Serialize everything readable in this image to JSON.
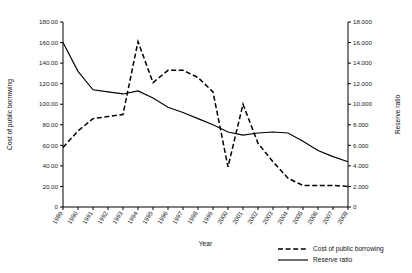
{
  "chart_data": {
    "type": "line",
    "title": "",
    "xlabel": "Year",
    "ylabel": "Cost of public borrowing",
    "y2label": "Reserve ratio",
    "grid": false,
    "legend_position": "bottom-right",
    "x": [
      1989,
      1990,
      1991,
      1992,
      1993,
      1994,
      1995,
      1996,
      1997,
      1998,
      1999,
      2000,
      2001,
      2002,
      2003,
      2004,
      2005,
      2006,
      2007,
      2008
    ],
    "categories": [
      "1989",
      "1990",
      "1991",
      "1992",
      "1993",
      "1994",
      "1995",
      "1996",
      "1997",
      "1998",
      "1999",
      "2000",
      "2001",
      "2002",
      "2003",
      "2004",
      "2005",
      "2006",
      "2007",
      "2008"
    ],
    "ylim": [
      0,
      180
    ],
    "yticks": [
      "0",
      "20.00",
      "40.00",
      "60.00",
      "80.00",
      "100.00",
      "120.00",
      "140.00",
      "160.00",
      "180.00"
    ],
    "ytick_values": [
      0,
      20,
      40,
      60,
      80,
      100,
      120,
      140,
      160,
      180
    ],
    "y2lim": [
      0,
      18
    ],
    "y2ticks": [
      "0",
      "2.000",
      "4.000",
      "6.000",
      "8.000",
      "10.000",
      "12.000",
      "14.000",
      "16.000",
      "18.000"
    ],
    "y2tick_values": [
      0,
      2,
      4,
      6,
      8,
      10,
      12,
      14,
      16,
      18
    ],
    "series": [
      {
        "name": "Cost of public borrowing",
        "axis": "left",
        "style": "dashed",
        "values": [
          58,
          74,
          86,
          88,
          90,
          161,
          121,
          133,
          133,
          126,
          112,
          39,
          100,
          62,
          44,
          28,
          21,
          21,
          21,
          20
        ]
      },
      {
        "name": "Reserve ratio",
        "axis": "right",
        "style": "solid",
        "values": [
          16.0,
          13.2,
          11.4,
          11.2,
          11.0,
          11.3,
          10.6,
          9.7,
          9.2,
          8.6,
          8.0,
          7.3,
          7.0,
          7.2,
          7.3,
          7.2,
          6.4,
          5.5,
          4.9,
          4.4
        ]
      }
    ]
  },
  "legend": {
    "items": [
      {
        "label": "Cost of public borrowing",
        "style": "dashed"
      },
      {
        "label": "Reserve ratio",
        "style": "solid"
      }
    ]
  }
}
